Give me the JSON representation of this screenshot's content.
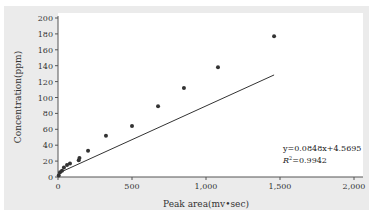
{
  "chart_data": {
    "type": "scatter",
    "title": "",
    "xlabel": "Peak area(mv•sec)",
    "ylabel": "Concentration(ppm)",
    "xlim": [
      0,
      2000
    ],
    "ylim": [
      0,
      200
    ],
    "x_ticks": [
      "0",
      "500",
      "1,000",
      "1,500",
      "2,000"
    ],
    "y_ticks": [
      "0",
      "20",
      "40",
      "60",
      "80",
      "100",
      "120",
      "140",
      "160",
      "180",
      "200"
    ],
    "grid": false,
    "legend": "none",
    "series": [
      {
        "name": "Measured",
        "points": [
          {
            "x": 5,
            "y": 2
          },
          {
            "x": 14,
            "y": 6
          },
          {
            "x": 27,
            "y": 8
          },
          {
            "x": 40,
            "y": 12
          },
          {
            "x": 61,
            "y": 15
          },
          {
            "x": 81,
            "y": 17
          },
          {
            "x": 140,
            "y": 21
          },
          {
            "x": 145,
            "y": 24
          },
          {
            "x": 203,
            "y": 33
          },
          {
            "x": 324,
            "y": 52
          },
          {
            "x": 500,
            "y": 64
          },
          {
            "x": 676,
            "y": 89
          },
          {
            "x": 851,
            "y": 112
          },
          {
            "x": 1081,
            "y": 138
          },
          {
            "x": 1460,
            "y": 177
          }
        ]
      }
    ],
    "trendline": {
      "type": "linear",
      "slope": 0.0848,
      "intercept": 4.5695,
      "x_range": [
        0,
        1460
      ]
    },
    "annotations": {
      "equation": "y=0.0848x+4.5695",
      "r_squared": "R²=0.9942"
    }
  }
}
